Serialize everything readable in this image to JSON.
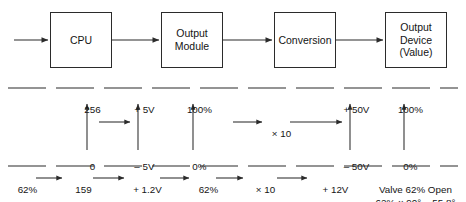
{
  "diagram": {
    "stroke_color": "#2b2b2b",
    "text_color": "#141414",
    "blocks": [
      {
        "id": "cpu",
        "label": "CPU"
      },
      {
        "id": "output-module",
        "label": "Output\nModule"
      },
      {
        "id": "conversion",
        "label": "Conversion"
      },
      {
        "id": "output-device",
        "label": "Output\nDevice\n(Value)"
      }
    ],
    "scale_top": [
      {
        "id": "count-max",
        "text": "256"
      },
      {
        "id": "volt-max",
        "text": "+ 5V"
      },
      {
        "id": "percent-max",
        "text": "100%"
      },
      {
        "id": "volt-max-out",
        "text": "+ 50V"
      },
      {
        "id": "percent-max-out",
        "text": "100%"
      }
    ],
    "scale_bottom": [
      {
        "id": "count-min",
        "text": "0"
      },
      {
        "id": "volt-min",
        "text": "– 5V"
      },
      {
        "id": "percent-min",
        "text": "0%"
      },
      {
        "id": "volt-min-out",
        "text": "– 50V"
      },
      {
        "id": "percent-min-out",
        "text": "0%"
      }
    ],
    "multipliers": [
      {
        "id": "gain-left",
        "text": ""
      },
      {
        "id": "gain-middle",
        "text": "× 10"
      }
    ],
    "example_chain": [
      {
        "id": "example-input-percent",
        "text": "62%"
      },
      {
        "id": "example-count",
        "text": "159"
      },
      {
        "id": "example-voltage-low",
        "text": "+ 1.2V"
      },
      {
        "id": "example-percent",
        "text": "62%"
      },
      {
        "id": "example-gain",
        "text": "× 10"
      },
      {
        "id": "example-voltage-high",
        "text": "+ 12V"
      }
    ],
    "result": {
      "line1": "Valve 62% Open",
      "line2": "62% × 90° = 55.8°"
    }
  }
}
